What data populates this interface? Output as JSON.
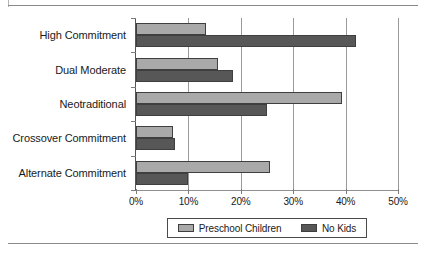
{
  "chart_data": {
    "type": "bar",
    "orientation": "horizontal",
    "title": "",
    "xlabel": "",
    "ylabel": "",
    "categories": [
      "High Commitment",
      "Dual Moderate",
      "Neotraditional",
      "Crossover Commitment",
      "Alternate Commitment"
    ],
    "series": [
      {
        "name": "Preschool Children",
        "color": "#a9a9a9",
        "values": [
          13.3,
          15.6,
          39.4,
          7.0,
          25.5
        ]
      },
      {
        "name": "No Kids",
        "color": "#575757",
        "values": [
          41.9,
          18.5,
          25.0,
          7.5,
          10.0
        ]
      }
    ],
    "xlim": [
      0,
      50
    ],
    "xtick_values": [
      0,
      10,
      20,
      30,
      40,
      50
    ],
    "xtick_labels": [
      "0%",
      "10%",
      "20%",
      "30%",
      "40%",
      "50%"
    ],
    "grid": true,
    "grid_axis": "x",
    "legend_position": "bottom-center",
    "value_suffix": "%"
  },
  "legend": {
    "items": [
      {
        "label": "Preschool Children",
        "color": "#a9a9a9"
      },
      {
        "label": "No Kids",
        "color": "#575757"
      }
    ]
  },
  "colors": {
    "series_light": "#a9a9a9",
    "series_dark": "#575757",
    "axis": "#555555",
    "grid": "#9a9a9a",
    "rule": "#8a8a8a",
    "text": "#1a1a1a",
    "background": "#ffffff"
  }
}
